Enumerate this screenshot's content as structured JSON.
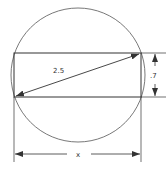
{
  "diagram": {
    "labels": {
      "diagonal": "2.5",
      "height": ".7",
      "width": "x"
    },
    "colors": {
      "stroke": "#333333",
      "background": "#ffffff"
    }
  }
}
